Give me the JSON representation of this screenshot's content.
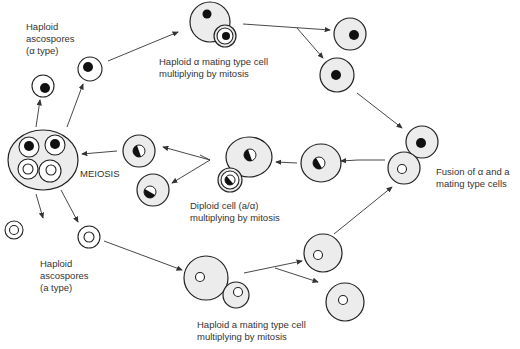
{
  "labels": {
    "alpha_ascospores": "Haploid\nascospores\n(α type)",
    "alpha_mitosis": "Haploid α mating type cell\nmultiplying by mitosis",
    "meiosis": "MEIOSIS",
    "diploid": "Diploid cell (a/α)\nmultiplying by mitosis",
    "fusion": "Fusion of α and a\nmating type cells",
    "a_ascospores": "Haploid\nascospores\n(a type)",
    "a_mitosis": "Haploid a mating type cell\nmultiplying by mitosis"
  },
  "legend_semantics": {
    "black_nucleus": "α mating type",
    "white_nucleus": "a mating type",
    "half_nucleus": "diploid a/α"
  }
}
